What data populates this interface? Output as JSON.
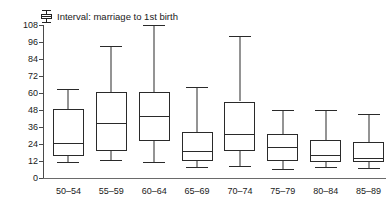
{
  "legend": {
    "icon": "boxplot-glyph-icon",
    "label": "Interval: marriage to 1st birth"
  },
  "chart_data": {
    "type": "box",
    "title": "",
    "subtitle": "",
    "xlabel": "",
    "ylabel": "",
    "ylim": [
      0,
      108
    ],
    "yticks": [
      0,
      12,
      24,
      36,
      48,
      60,
      72,
      84,
      96,
      108
    ],
    "ytick_labels": [
      "0",
      "12",
      "24",
      "36",
      "48",
      "60",
      "72",
      "84",
      "96",
      "108"
    ],
    "grid": false,
    "legend_position": "top-left",
    "categories": [
      "50–54",
      "55–59",
      "60–64",
      "65–69",
      "70–74",
      "75–79",
      "80–84",
      "85–89"
    ],
    "series": [
      {
        "name": "Interval: marriage to 1st birth",
        "boxes": [
          {
            "category": "50–54",
            "whisker_low": 11,
            "q1": 15.5,
            "median": 24.5,
            "q3": 48.5,
            "whisker_high": 63
          },
          {
            "category": "55–59",
            "whisker_low": 12.5,
            "q1": 19,
            "median": 39,
            "q3": 61,
            "whisker_high": 93
          },
          {
            "category": "60–64",
            "whisker_low": 11.5,
            "q1": 26,
            "median": 44,
            "q3": 60.5,
            "whisker_high": 108
          },
          {
            "category": "65–69",
            "whisker_low": 8,
            "q1": 12,
            "median": 19,
            "q3": 32.5,
            "whisker_high": 64
          },
          {
            "category": "70–74",
            "whisker_low": 8.5,
            "q1": 19,
            "median": 31,
            "q3": 54,
            "whisker_high": 100
          },
          {
            "category": "75–79",
            "whisker_low": 6.5,
            "q1": 12,
            "median": 22,
            "q3": 31,
            "whisker_high": 48
          },
          {
            "category": "80–84",
            "whisker_low": 7.5,
            "q1": 11,
            "median": 16.5,
            "q3": 27,
            "whisker_high": 48
          },
          {
            "category": "85–89",
            "whisker_low": 7,
            "q1": 11.5,
            "median": 14,
            "q3": 25.5,
            "whisker_high": 45
          }
        ]
      }
    ]
  },
  "colors": {
    "line": "#2a2a2a",
    "axis": "#4a4a4a",
    "text": "#1a1a1a",
    "background": "#ffffff"
  }
}
